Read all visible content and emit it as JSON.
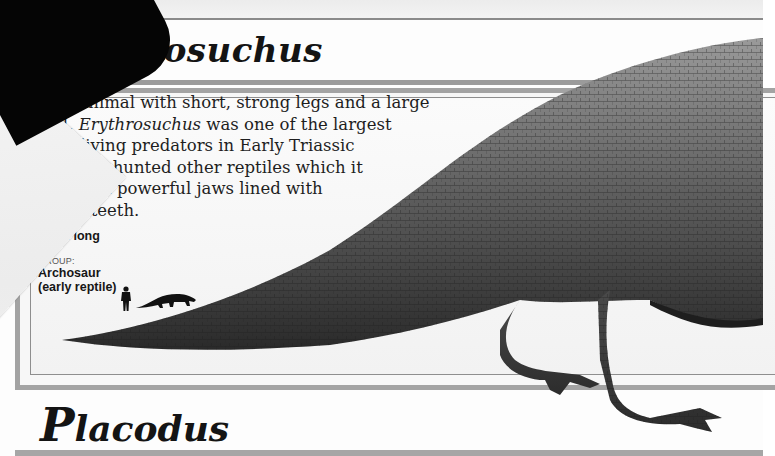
{
  "entry_1": {
    "title_visible": "hrosuchus",
    "title_full": "Erythrosuchus",
    "description_lines": [
      "ulky animal with short, strong legs and a large",
      "ead, ",
      "land-living predators in Early Triassic",
      "times. It hunted other reptiles which it",
      "seized in powerful jaws lined with",
      "sharp teeth."
    ],
    "description_line2_italic": "Erythrosuchus",
    "description_line2_rest": " was one of the largest",
    "size_label": "SIZE:",
    "size_value": "4.5 m long",
    "group_label": "GROUP:",
    "group_value_line1": "Archosaur",
    "group_value_line2": "(early reptile)",
    "scale_icons": [
      "human-silhouette",
      "erythrosuchus-silhouette"
    ]
  },
  "entry_2": {
    "title_initial": "P",
    "title_rest": "lacodus"
  },
  "colors": {
    "text": "#1e1e1e",
    "rule": "#a3a3a3",
    "fold": "#050505"
  }
}
